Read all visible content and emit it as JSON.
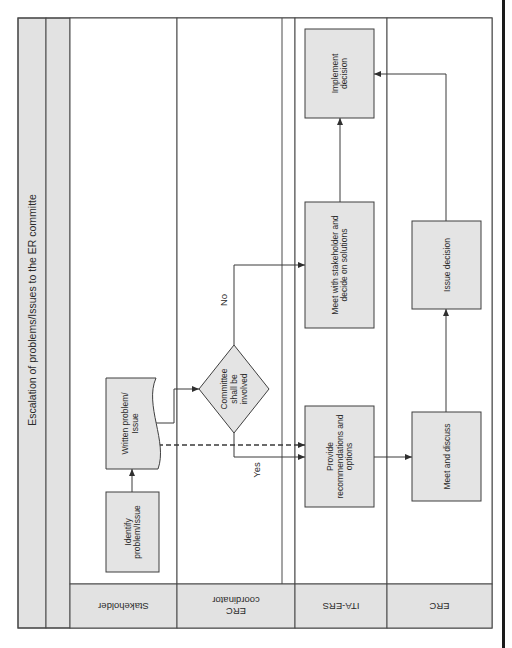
{
  "diagram": {
    "title": "Escalation of problems/Issues to the ER committe",
    "colors": {
      "line": "#4a4a4a",
      "header_fill": "#e2e2e2",
      "box_fill": "#e4e4e4",
      "background": "#ffffff",
      "edge_bar": "#1a1a1a"
    },
    "frame": {
      "x1": 18,
      "y1": 18,
      "x2": 492,
      "y2": 628
    },
    "title_column": {
      "x1": 18,
      "x2": 46
    },
    "spacer_column": {
      "x1": 46,
      "x2": 70
    },
    "lane_header_top": 584,
    "lanes": [
      {
        "id": "stakeholder",
        "label": "Stakeholder",
        "x1": 70,
        "x2": 177
      },
      {
        "id": "erc-coordinator",
        "label": "ERC\ncoordinator",
        "x1": 177,
        "x2": 295,
        "inner_line_x": 282
      },
      {
        "id": "ita-ers",
        "label": "ITA-ERS",
        "x1": 295,
        "x2": 387
      },
      {
        "id": "erc",
        "label": "ERC",
        "x1": 387,
        "x2": 492
      }
    ],
    "nodes": [
      {
        "id": "identify",
        "shape": "rect",
        "lane": "stakeholder",
        "label": "Identify\nproblem/Issue",
        "x": 106,
        "y": 492,
        "w": 53,
        "h": 80
      },
      {
        "id": "written",
        "shape": "document",
        "lane": "stakeholder",
        "label": "Written problem/\nIssue",
        "x": 106,
        "y": 378,
        "w": 52,
        "h": 91
      },
      {
        "id": "decision",
        "shape": "diamond",
        "lane": "erc-coordinator",
        "label": "Committee\nshall be\ninvolved",
        "cx": 234,
        "cy": 389,
        "rx": 35,
        "ry": 44
      },
      {
        "id": "meet-stakeholder",
        "shape": "rect",
        "lane": "ita-ers",
        "label": "Meet with stakeholder and\ndecide on solutions",
        "x": 305,
        "y": 202,
        "w": 69,
        "h": 126
      },
      {
        "id": "provide",
        "shape": "rect",
        "lane": "ita-ers",
        "label": "Provide\nrecommendations and\noptions",
        "x": 305,
        "y": 406,
        "w": 69,
        "h": 101
      },
      {
        "id": "implement",
        "shape": "rect",
        "lane": "ita-ers",
        "label": "Implement\ndecision",
        "x": 305,
        "y": 29,
        "w": 69,
        "h": 89
      },
      {
        "id": "meet-discuss",
        "shape": "rect",
        "lane": "erc",
        "label": "Meet and discuss",
        "x": 412,
        "y": 412,
        "w": 69,
        "h": 89
      },
      {
        "id": "issue-decision",
        "shape": "rect",
        "lane": "erc",
        "label": "Issue decision",
        "x": 412,
        "y": 221,
        "w": 69,
        "h": 88
      }
    ],
    "edges": [
      {
        "id": "identify-to-written",
        "from": "identify",
        "to": "written",
        "points": [
          [
            132,
            492
          ],
          [
            132,
            469
          ]
        ],
        "style": "solid"
      },
      {
        "id": "written-to-decision",
        "from": "written",
        "to": "decision",
        "points": [
          [
            153,
            423
          ],
          [
            174,
            423
          ],
          [
            174,
            389
          ],
          [
            199,
            389
          ]
        ],
        "style": "solid"
      },
      {
        "id": "written-to-provide-dashed",
        "from": "written",
        "to": "provide",
        "points": [
          [
            158,
            445
          ],
          [
            305,
            445
          ]
        ],
        "style": "dashed"
      },
      {
        "id": "decision-no",
        "from": "decision",
        "to": "meet-stakeholder",
        "label": "No",
        "label_pos": [
          227,
          300
        ],
        "points": [
          [
            234,
            345
          ],
          [
            234,
            265
          ],
          [
            305,
            265
          ]
        ],
        "style": "solid"
      },
      {
        "id": "decision-yes",
        "from": "decision",
        "to": "provide",
        "label": "Yes",
        "label_pos": [
          260,
          470
        ],
        "points": [
          [
            234,
            433
          ],
          [
            234,
            457
          ],
          [
            305,
            457
          ]
        ],
        "style": "solid"
      },
      {
        "id": "provide-to-meet-discuss",
        "from": "provide",
        "to": "meet-discuss",
        "points": [
          [
            374,
            457
          ],
          [
            412,
            457
          ]
        ],
        "style": "solid"
      },
      {
        "id": "meet-discuss-to-issue",
        "from": "meet-discuss",
        "to": "issue-decision",
        "points": [
          [
            446,
            412
          ],
          [
            446,
            309
          ]
        ],
        "style": "solid"
      },
      {
        "id": "issue-to-implement",
        "from": "issue-decision",
        "to": "implement",
        "points": [
          [
            446,
            221
          ],
          [
            446,
            74
          ],
          [
            374,
            74
          ]
        ],
        "style": "solid"
      },
      {
        "id": "meet-stakeholder-to-implement",
        "from": "meet-stakeholder",
        "to": "implement",
        "points": [
          [
            340,
            202
          ],
          [
            340,
            118
          ]
        ],
        "style": "solid"
      }
    ]
  }
}
